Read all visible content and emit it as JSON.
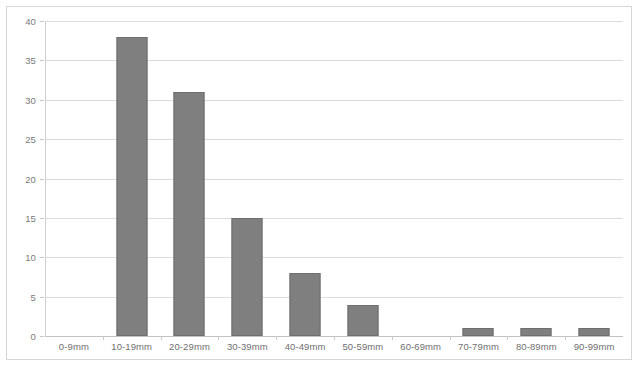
{
  "chart_data": {
    "type": "bar",
    "title": "",
    "subtitle": "",
    "xlabel": "",
    "ylabel": "",
    "categories": [
      "0-9mm",
      "10-19mm",
      "20-29mm",
      "30-39mm",
      "40-49mm",
      "50-59mm",
      "60-69mm",
      "70-79mm",
      "80-89mm",
      "90-99mm"
    ],
    "values": [
      0,
      38,
      31,
      15,
      8,
      4,
      0,
      1,
      1,
      1
    ],
    "series": [
      {
        "name": "Frequency",
        "values": [
          0,
          38,
          31,
          15,
          8,
          4,
          0,
          1,
          1,
          1
        ]
      }
    ],
    "ylim": [
      0,
      40
    ],
    "ytick_step": 5,
    "ytick_labels": [
      "0",
      "5",
      "10",
      "15",
      "20",
      "25",
      "30",
      "35",
      "40"
    ],
    "ytick_values": [
      0,
      5,
      10,
      15,
      20,
      25,
      30,
      35,
      40
    ],
    "grid": true,
    "grid_axis": "y",
    "legend": false,
    "legend_position": "none",
    "annotations": [],
    "colors": {
      "bar_fill": "#7f7f7f",
      "bar_border": "#6e6e6e",
      "gridline": "#dcdcdc",
      "axis_line": "#c2c2c2",
      "tick_label": "#6f6f6f",
      "plot_border": "#d6d6d6",
      "background": "#ffffff"
    }
  }
}
